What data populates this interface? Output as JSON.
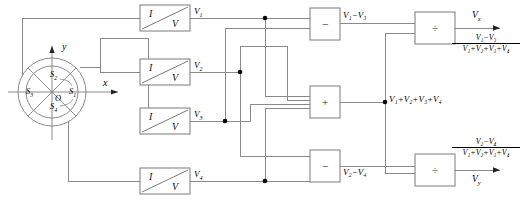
{
  "figure": {
    "type": "quadrant-photodetector-position-sensing-circuit",
    "detector": {
      "name": "quadrant-photodetector",
      "origin_label": "O",
      "axis_x_label": "x",
      "axis_y_label": "y",
      "segments": [
        {
          "id": "S1",
          "label": "S",
          "index": "1",
          "position": "right"
        },
        {
          "id": "S2",
          "label": "S",
          "index": "2",
          "position": "top"
        },
        {
          "id": "S3",
          "label": "S",
          "index": "3",
          "position": "left"
        },
        {
          "id": "S4",
          "label": "S",
          "index": "4",
          "position": "bottom"
        }
      ]
    },
    "converters": [
      {
        "id": "iv1",
        "input_label": "I",
        "output_label": "V",
        "signal": "V",
        "signal_index": "1"
      },
      {
        "id": "iv2",
        "input_label": "I",
        "output_label": "V",
        "signal": "V",
        "signal_index": "2"
      },
      {
        "id": "iv3",
        "input_label": "I",
        "output_label": "V",
        "signal": "V",
        "signal_index": "3"
      },
      {
        "id": "iv4",
        "input_label": "I",
        "output_label": "V",
        "signal": "V",
        "signal_index": "4"
      }
    ],
    "operators": [
      {
        "id": "diff-top",
        "symbol": "−",
        "kind": "difference-amplifier"
      },
      {
        "id": "sum-center",
        "symbol": "+",
        "kind": "summing-amplifier"
      },
      {
        "id": "diff-bottom",
        "symbol": "−",
        "kind": "difference-amplifier"
      },
      {
        "id": "div-top",
        "symbol": "÷",
        "kind": "divider"
      },
      {
        "id": "div-bottom",
        "symbol": "÷",
        "kind": "divider"
      }
    ],
    "signals": {
      "diff_top_out": "V₁−V₃",
      "sum_out": "V₁+V₂+V₃+V₄",
      "diff_bottom_out": "V₂−V₄"
    },
    "outputs": [
      {
        "id": "vx",
        "name": "V",
        "subscript": "x",
        "numerator": "V₁−V₃",
        "denominator": "V₁+V₂+V₃+V₄"
      },
      {
        "id": "vy",
        "name": "V",
        "subscript": "y",
        "numerator": "V₂−V₄",
        "denominator": "V₁+V₂+V₃+V₄"
      }
    ],
    "colors": {
      "wire": "#8a8a8a",
      "outline": "#7a7a7a",
      "text": "#111111",
      "node": "#000000"
    }
  }
}
